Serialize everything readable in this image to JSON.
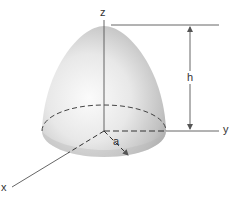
{
  "diagram": {
    "type": "3d-solid-figure",
    "shape": "paraboloid",
    "labels": {
      "z_axis": "z",
      "y_axis": "y",
      "x_axis": "x",
      "height": "h",
      "radius": "a"
    },
    "colors": {
      "line": "#555555",
      "surface_light": "#f4f4f4",
      "surface_dark": "#a9a9a9",
      "background": "#ffffff"
    }
  }
}
